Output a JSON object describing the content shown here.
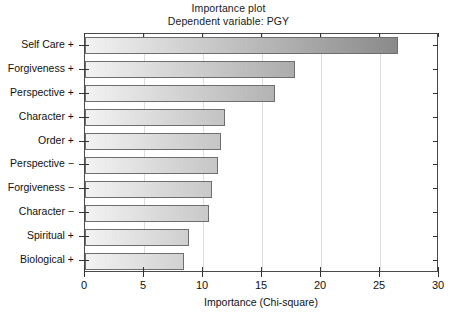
{
  "chart_data": {
    "type": "bar",
    "orientation": "horizontal",
    "title": "Importance plot",
    "subtitle": "Dependent variable: PGY",
    "xlabel": "Importance (Chi-square)",
    "ylabel": "",
    "xlim": [
      0,
      30
    ],
    "xticks": [
      0,
      5,
      10,
      15,
      20,
      25,
      30
    ],
    "xtick_labels": [
      "0",
      "5",
      "10",
      "15",
      "20",
      "25",
      "30"
    ],
    "grid": true,
    "grid_axis": "x",
    "legend": false,
    "categories": [
      "Self Care +",
      "Forgiveness +",
      "Perspective +",
      "Character +",
      "Order +",
      "Perspective −",
      "Forgiveness −",
      "Character −",
      "Spiritual +",
      "Biological +"
    ],
    "values": [
      26.5,
      17.8,
      16.1,
      11.9,
      11.5,
      11.3,
      10.8,
      10.5,
      8.8,
      8.4
    ],
    "bar_gradient_start_color": "#f2f2f2",
    "bar_gradient_end_color": "#8a8a8a",
    "bar_border_color": "#6e6e6e",
    "frame_color": "#4a4a4a",
    "grid_color": "#dcdcdc",
    "background_color": "#ffffff"
  },
  "titles": {
    "line1": "Importance plot",
    "line2": "Dependent variable: PGY"
  },
  "axes": {
    "x_title": "Importance (Chi-square)"
  }
}
